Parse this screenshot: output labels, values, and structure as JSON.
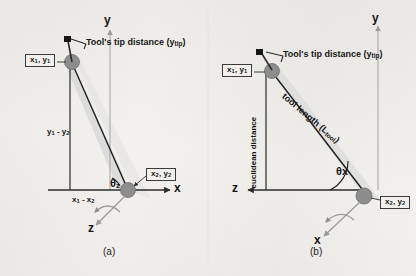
{
  "figure": {
    "background_color": "#f3f1ee",
    "ink_color": "#1a1a1a",
    "joint_color": "#8a8a8a",
    "shaft_color": "#cfcfcf"
  },
  "panel_a": {
    "caption": "(a)",
    "axes": {
      "y_label": "y",
      "x_label": "x",
      "z_label": "z"
    },
    "labels": {
      "tool_tip_distance": "Tool's tip distance (y",
      "tool_tip_distance_sub": "tip",
      "tool_tip_distance_end": ")",
      "point1": "x",
      "point1_sub1": "1",
      "point1_mid": ", y",
      "point1_sub2": "1",
      "point2": "x",
      "point2_sub1": "2",
      "point2_mid": ", y",
      "point2_sub2": "2",
      "dy": "y",
      "dy_sub1": "1",
      "dy_mid": " - y",
      "dy_sub2": "2",
      "dx": "x",
      "dx_sub1": "1",
      "dx_mid": " - x",
      "dx_sub2": "2",
      "theta": "θ",
      "theta_sub": "z"
    }
  },
  "panel_b": {
    "caption": "(b)",
    "axes": {
      "y_label": "y",
      "x_label": "x",
      "z_label": "z"
    },
    "labels": {
      "tool_tip_distance": "Tool's tip distance (y",
      "tool_tip_distance_sub": "tip",
      "tool_tip_distance_end": ")",
      "point1": "x",
      "point1_sub1": "1",
      "point1_mid": ", y",
      "point1_sub2": "1",
      "point2": "x",
      "point2_sub1": "2",
      "point2_mid": ", y",
      "point2_sub2": "2",
      "euclidean": "euclidean distance",
      "tool_length": "tool length (L",
      "tool_length_sub": "tool",
      "tool_length_end": ")",
      "theta": "θ",
      "theta_sub": "x"
    }
  }
}
